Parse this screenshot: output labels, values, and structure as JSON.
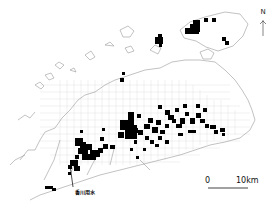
{
  "map": {
    "north_label": "N",
    "scale_bar": {
      "start_label": "0",
      "end_label": "10km"
    },
    "annotation": "香川用水",
    "colors": {
      "grid_cell": "#000000",
      "coastline": "#9a9a9a",
      "grid_lines": "#d6d6d6",
      "background": "#ffffff"
    }
  }
}
